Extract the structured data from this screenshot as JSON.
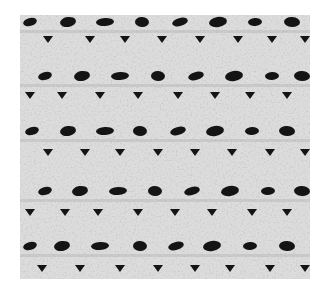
{
  "image": {
    "subject": "crochet stitch swatch photograph",
    "style": "black and white",
    "colors": {
      "background": "#ffffff",
      "fabric": "#dcdcdc",
      "fabric_shadow": "#a8a8a8",
      "holes": "#141414"
    }
  },
  "swatch": {
    "x": 20,
    "y": 15,
    "width": 290,
    "height": 264,
    "large_hole_rows": [
      {
        "y": 22,
        "xs": [
          30,
          68,
          105,
          142,
          180,
          218,
          255,
          292
        ]
      },
      {
        "y": 76,
        "xs": [
          45,
          82,
          120,
          158,
          196,
          234,
          272,
          302
        ]
      },
      {
        "y": 131,
        "xs": [
          32,
          68,
          105,
          140,
          178,
          215,
          252,
          287
        ]
      },
      {
        "y": 191,
        "xs": [
          45,
          80,
          118,
          155,
          192,
          230,
          268,
          302
        ]
      },
      {
        "y": 246,
        "xs": [
          30,
          62,
          100,
          140,
          176,
          212,
          250,
          287
        ]
      }
    ],
    "small_hole_rows": [
      {
        "y": 39,
        "xs": [
          48,
          90,
          125,
          162,
          200,
          238,
          272,
          305
        ]
      },
      {
        "y": 95,
        "xs": [
          30,
          62,
          100,
          138,
          178,
          215,
          250,
          287
        ]
      },
      {
        "y": 152,
        "xs": [
          48,
          85,
          120,
          158,
          195,
          232,
          270,
          305
        ]
      },
      {
        "y": 212,
        "xs": [
          30,
          65,
          98,
          138,
          175,
          212,
          252,
          287
        ]
      },
      {
        "y": 268,
        "xs": [
          42,
          80,
          120,
          158,
          195,
          230,
          270,
          305
        ]
      }
    ]
  }
}
